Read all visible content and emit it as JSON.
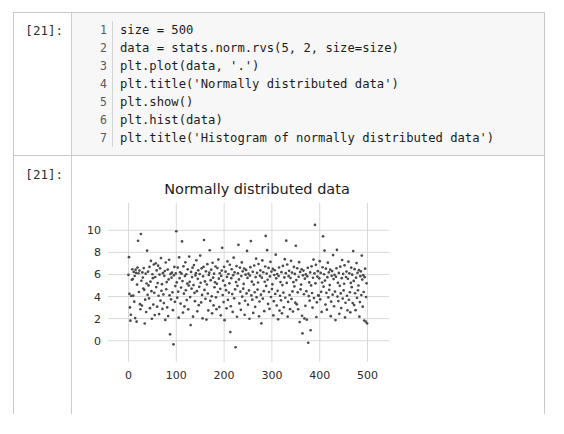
{
  "notebook": {
    "input_cell": {
      "prompt": "[21]:",
      "lines": [
        {
          "no": "1",
          "code": "size = 500"
        },
        {
          "no": "2",
          "code": "data = stats.norm.rvs(5, 2, size=size)"
        },
        {
          "no": "3",
          "code": "plt.plot(data, '.')"
        },
        {
          "no": "4",
          "code": "plt.title('Normally distributed data')"
        },
        {
          "no": "5",
          "code": "plt.show()"
        },
        {
          "no": "6",
          "code": "plt.hist(data)"
        },
        {
          "no": "7",
          "code": "plt.title('Histogram of normally distributed data')"
        }
      ]
    },
    "output_cell": {
      "prompt": "[21]:"
    }
  },
  "colors": {
    "cell_border": "#c9c9c9",
    "code_background": "#f7f7f7",
    "gutter_background": "#ffffff",
    "grid": "#d9d9d9",
    "marker": "#4b4b4b",
    "text": "#1b1b1b"
  },
  "chart_data": {
    "type": "scatter",
    "title": "Normally distributed data",
    "xlabel": "",
    "ylabel": "",
    "grid": true,
    "legend": null,
    "marker": ".",
    "marker_color": "#4b4b4b",
    "xlim": [
      -24,
      524
    ],
    "ylim": [
      -1.2,
      11.2
    ],
    "xticks": [
      0,
      100,
      200,
      300,
      400,
      500
    ],
    "yticks": [
      0,
      2,
      4,
      6,
      8,
      10
    ],
    "xtick_labels": [
      "0",
      "100",
      "200",
      "300",
      "400",
      "500"
    ],
    "ytick_labels": [
      "0",
      "2",
      "4",
      "6",
      "8",
      "10"
    ],
    "distribution": {
      "name": "normal",
      "mean": 5,
      "sigma": 2,
      "n": 500
    },
    "x": "index 0..499",
    "y_summary": {
      "min": -0.6,
      "max": 10.5,
      "mean": 5.0,
      "std": 2.0
    },
    "y": [
      5.97,
      7.56,
      4.24,
      3.02,
      1.82,
      2.35,
      4.05,
      5.52,
      6.47,
      5.58,
      4.08,
      6.23,
      3.54,
      5.86,
      2.05,
      6.43,
      6.14,
      1.73,
      5.08,
      6.62,
      9.05,
      6.11,
      4.41,
      6.35,
      3.31,
      2.85,
      9.66,
      5.43,
      3.18,
      6.18,
      5.72,
      4.73,
      6.58,
      4.61,
      1.56,
      3.72,
      6.07,
      2.6,
      5.18,
      8.15,
      4.16,
      6.25,
      5.01,
      3.83,
      6.68,
      2.95,
      5.35,
      7.22,
      4.49,
      1.99,
      6.02,
      5.66,
      3.27,
      6.9,
      4.34,
      2.32,
      5.77,
      7.01,
      4.86,
      6.36,
      3.08,
      5.22,
      6.79,
      4.07,
      2.41,
      5.99,
      6.55,
      3.63,
      7.48,
      4.52,
      5.12,
      2.88,
      6.12,
      4.19,
      3.41,
      5.88,
      6.31,
      1.88,
      7.08,
      4.66,
      5.31,
      3.02,
      6.44,
      2.23,
      5.55,
      7.33,
      4.11,
      0.58,
      6.05,
      3.75,
      5.71,
      6.16,
      4.38,
      2.77,
      -0.32,
      5.92,
      6.68,
      3.52,
      4.95,
      6.09,
      9.91,
      5.28,
      3.9,
      6.62,
      4.44,
      2.09,
      7.55,
      5.66,
      6.2,
      3.36,
      4.81,
      6.07,
      8.99,
      5.4,
      2.55,
      6.74,
      4.26,
      3.11,
      5.85,
      7.1,
      4.57,
      6.02,
      3.68,
      5.17,
      6.46,
      2.84,
      4.99,
      7.62,
      5.33,
      3.95,
      1.42,
      6.23,
      4.71,
      5.76,
      6.61,
      2.18,
      5.04,
      6.85,
      4.33,
      3.58,
      5.91,
      6.12,
      7.28,
      4.49,
      2.66,
      5.6,
      6.37,
      3.22,
      4.88,
      6.03,
      7.71,
      5.25,
      3.47,
      6.55,
      4.15,
      2.02,
      5.83,
      6.68,
      9.12,
      4.6,
      5.37,
      3.79,
      6.28,
      1.92,
      5.09,
      6.93,
      4.27,
      2.74,
      5.95,
      6.16,
      8.19,
      3.61,
      5.48,
      6.43,
      4.02,
      2.48,
      7.06,
      5.71,
      3.2,
      6.07,
      4.84,
      5.29,
      6.72,
      3.93,
      2.86,
      5.16,
      6.58,
      4.41,
      7.35,
      5.62,
      3.05,
      6.11,
      4.7,
      2.3,
      5.87,
      6.35,
      8.41,
      4.13,
      5.44,
      3.5,
      6.69,
      1.86,
      5.01,
      6.25,
      4.58,
      2.93,
      5.78,
      7.18,
      3.69,
      6.04,
      4.36,
      5.2,
      6.88,
      0.78,
      3.12,
      5.66,
      6.47,
      4.22,
      2.61,
      5.93,
      7.52,
      3.84,
      6.19,
      4.65,
      -0.59,
      5.31,
      6.76,
      2.17,
      4.97,
      6.1,
      8.68,
      5.55,
      3.38,
      6.62,
      4.44,
      2.8,
      5.85,
      7.09,
      3.99,
      6.28,
      4.71,
      5.14,
      6.53,
      2.35,
      3.62,
      5.98,
      6.41,
      4.28,
      8.13,
      5.69,
      3.26,
      6.07,
      4.55,
      1.99,
      5.9,
      6.66,
      9.02,
      4.1,
      5.35,
      3.72,
      6.24,
      2.52,
      5.08,
      6.81,
      4.39,
      3.07,
      5.76,
      7.43,
      3.93,
      6.15,
      4.63,
      5.27,
      6.94,
      2.21,
      3.55,
      5.88,
      6.36,
      4.17,
      1.57,
      5.71,
      7.27,
      3.81,
      6.2,
      4.49,
      2.68,
      5.34,
      6.72,
      9.49,
      4.96,
      6.08,
      8.2,
      5.52,
      3.33,
      6.59,
      4.41,
      2.88,
      5.82,
      7.14,
      3.96,
      6.26,
      4.68,
      5.11,
      6.5,
      2.29,
      3.58,
      5.95,
      6.38,
      4.24,
      7.79,
      5.65,
      3.19,
      6.04,
      4.52,
      1.94,
      5.86,
      6.63,
      2.73,
      4.07,
      5.31,
      3.66,
      6.21,
      2.48,
      5.04,
      6.77,
      4.35,
      3.03,
      5.73,
      7.38,
      3.89,
      6.12,
      9.06,
      5.23,
      6.9,
      2.18,
      3.51,
      5.84,
      6.33,
      4.14,
      2.86,
      5.68,
      7.23,
      3.78,
      6.17,
      4.46,
      2.64,
      5.3,
      6.68,
      4.92,
      6.05,
      3.45,
      8.6,
      5.49,
      3.3,
      6.56,
      4.38,
      2.85,
      5.79,
      7.11,
      1.69,
      6.23,
      4.65,
      5.08,
      6.47,
      2.26,
      0.66,
      5.92,
      6.35,
      4.21,
      2.02,
      5.62,
      3.16,
      6.01,
      4.49,
      1.91,
      5.83,
      6.6,
      -0.18,
      4.04,
      5.28,
      3.63,
      6.18,
      0.95,
      5.01,
      6.74,
      4.32,
      3,
      5.7,
      7.35,
      3.86,
      6.09,
      10.48,
      5.2,
      6.87,
      2.15,
      3.48,
      5.81,
      6.3,
      4.11,
      4.08,
      5.65,
      7.2,
      3.75,
      6.14,
      4.43,
      2.61,
      5.27,
      6.65,
      9.45,
      4.89,
      6.02,
      8.16,
      5.45,
      3.27,
      6.52,
      4.34,
      2.81,
      5.75,
      7.07,
      3.92,
      6.19,
      4.61,
      5.04,
      6.43,
      2.22,
      3.54,
      5.88,
      6.31,
      4.17,
      7.75,
      5.58,
      3.12,
      5.97,
      4.45,
      1.87,
      5.79,
      6.56,
      8.22,
      4,
      5.24,
      3.59,
      6.14,
      2.44,
      4.97,
      6.7,
      4.28,
      2.96,
      5.66,
      7.31,
      3.82,
      6.05,
      4.55,
      5.16,
      6.83,
      2.11,
      3.44,
      5.77,
      6.26,
      4.07,
      2.75,
      5.61,
      7.16,
      3.71,
      6.1,
      4.39,
      2.57,
      5.23,
      6.61,
      4.85,
      5.98,
      3.41,
      8.12,
      5.41,
      3.23,
      6.48,
      4.3,
      2.77,
      5.71,
      7.03,
      3.88,
      6.15,
      4.57,
      5,
      6.39,
      2.18,
      3.5,
      5.84,
      6.27,
      4.13,
      7.71,
      5.54,
      3.08,
      5.93,
      4.41,
      1.83,
      5.75,
      6.52,
      1.74,
      3.96,
      5.2,
      1.58
    ]
  }
}
